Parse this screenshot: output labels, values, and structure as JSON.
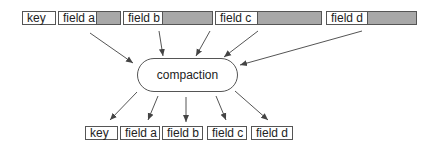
{
  "diagram": {
    "title": "",
    "colors": {
      "padding_fill": "#a8a8a8",
      "stroke": "#555555"
    },
    "input_row": [
      {
        "id": "key",
        "label": "key",
        "x": 22,
        "y": 11,
        "w": 34,
        "pad_w": 0
      },
      {
        "id": "field_a",
        "label": "field a",
        "x": 58,
        "y": 11,
        "w": 63,
        "pad_w": 24
      },
      {
        "id": "field_b",
        "label": "field b",
        "x": 123,
        "y": 11,
        "w": 90,
        "pad_w": 50
      },
      {
        "id": "field_c",
        "label": "field c",
        "x": 215,
        "y": 11,
        "w": 107,
        "pad_w": 64
      },
      {
        "id": "field_d",
        "label": "field d",
        "x": 326,
        "y": 11,
        "w": 91,
        "pad_w": 49
      }
    ],
    "process": {
      "label": "compaction"
    },
    "output_row": [
      {
        "id": "key",
        "label": "key",
        "x": 85,
        "y": 126,
        "w": 33
      },
      {
        "id": "field_a",
        "label": "field a",
        "x": 120,
        "y": 126,
        "w": 40
      },
      {
        "id": "field_b",
        "label": "field b",
        "x": 162,
        "y": 126,
        "w": 41
      },
      {
        "id": "field_c",
        "label": "field c",
        "x": 207,
        "y": 126,
        "w": 40
      },
      {
        "id": "field_d",
        "label": "field d",
        "x": 251,
        "y": 126,
        "w": 42
      }
    ],
    "edges_in": [
      {
        "from": "field_a",
        "x1": 90,
        "y1": 33,
        "x2": 133,
        "y2": 63
      },
      {
        "from": "field_b",
        "x1": 159,
        "y1": 31,
        "x2": 163,
        "y2": 56
      },
      {
        "from": "field_b",
        "x1": 210,
        "y1": 31,
        "x2": 196,
        "y2": 56
      },
      {
        "from": "field_c",
        "x1": 258,
        "y1": 31,
        "x2": 224,
        "y2": 57
      },
      {
        "from": "field_d",
        "x1": 362,
        "y1": 31,
        "x2": 240,
        "y2": 65
      }
    ],
    "edges_out": [
      {
        "to": "key",
        "x1": 137,
        "y1": 92,
        "x2": 110,
        "y2": 120
      },
      {
        "to": "field_a",
        "x1": 158,
        "y1": 96,
        "x2": 148,
        "y2": 120
      },
      {
        "to": "field_b",
        "x1": 186,
        "y1": 97,
        "x2": 186,
        "y2": 122
      },
      {
        "to": "field_c",
        "x1": 216,
        "y1": 96,
        "x2": 226,
        "y2": 120
      },
      {
        "to": "field_d",
        "x1": 235,
        "y1": 91,
        "x2": 268,
        "y2": 120
      }
    ]
  }
}
